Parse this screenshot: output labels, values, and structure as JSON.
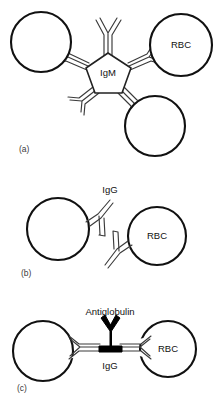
{
  "figure": {
    "colors": {
      "cell_stroke": "#111111",
      "cell_fill": "#ffffff",
      "antibody_outline_stroke": "#3a3a3a",
      "antibody_solid_fill": "#000000",
      "text": "#111111",
      "background": "#ffffff"
    },
    "panels": [
      {
        "id": "a",
        "panel_label": "(a)",
        "center_molecule_label": "IgM",
        "cell_labels": [
          "",
          "RBC",
          ""
        ],
        "cells": [
          {
            "name": "left-cell",
            "cx": 41,
            "cy": 42,
            "r": 30,
            "label": ""
          },
          {
            "name": "right-cell",
            "cx": 181,
            "cy": 45,
            "r": 31,
            "label": "RBC"
          },
          {
            "name": "bottom-cell",
            "cx": 155,
            "cy": 126,
            "r": 30,
            "label": ""
          }
        ]
      },
      {
        "id": "b",
        "panel_label": "(b)",
        "antibody_label": "IgG",
        "cell_labels": [
          "",
          "RBC"
        ],
        "cells": [
          {
            "name": "left-cell",
            "cx": 58,
            "cy": 229,
            "r": 31,
            "label": ""
          },
          {
            "name": "right-cell",
            "cx": 157,
            "cy": 236,
            "r": 29,
            "label": "RBC"
          }
        ]
      },
      {
        "id": "c",
        "panel_label": "(c)",
        "bridge_label": "Antiglobulin",
        "antibody_label": "IgG",
        "cell_labels": [
          "",
          "RBC"
        ],
        "cells": [
          {
            "name": "left-cell",
            "cx": 43,
            "cy": 351,
            "r": 30,
            "label": ""
          },
          {
            "name": "right-cell",
            "cx": 168,
            "cy": 349,
            "r": 28,
            "label": "RBC"
          }
        ]
      }
    ]
  }
}
